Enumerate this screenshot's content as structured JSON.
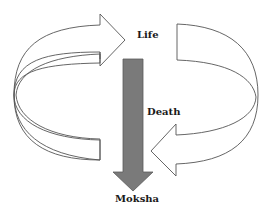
{
  "diagram": {
    "labels": {
      "life": "Life",
      "death": "Death",
      "moksha": "Moksha"
    },
    "nodes": [
      {
        "id": "life",
        "label": "Life"
      },
      {
        "id": "death",
        "label": "Death"
      },
      {
        "id": "moksha",
        "label": "Moksha"
      }
    ],
    "edges": [
      {
        "from": "death",
        "to": "life",
        "style": "curved outline arrow (left loop, pointing right)"
      },
      {
        "from": "life",
        "to": "death",
        "style": "curved outline arrow (right loop, pointing left)"
      },
      {
        "from": "life",
        "to": "moksha",
        "style": "solid gray downward arrow"
      }
    ],
    "colors": {
      "outline": "#555555",
      "down_arrow_fill": "#7a7a7a",
      "down_arrow_stroke": "#5a5a5a",
      "text": "#1a1a1a",
      "background": "#ffffff"
    }
  }
}
